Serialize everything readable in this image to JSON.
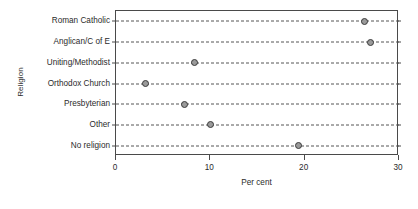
{
  "chart_data": {
    "type": "scatter",
    "title": "",
    "xlabel": "Per cent",
    "ylabel": "Religion",
    "categories": [
      "Roman Catholic",
      "Anglican/C of E",
      "Uniting/Methodist",
      "Orthodox Church",
      "Presbyterian",
      "Other",
      "No religion"
    ],
    "values": [
      26.3,
      27.0,
      8.3,
      3.1,
      7.3,
      10.0,
      19.3
    ],
    "xlim": [
      0,
      30
    ],
    "xticks": [
      0,
      10,
      20,
      30
    ],
    "xtick_labels": [
      "0",
      "10",
      "20",
      "30"
    ],
    "grid": "dashed-horizontal",
    "legend": "none",
    "orientation": "horizontal",
    "marker": {
      "shape": "circle",
      "fill_color": "#9a9a9a",
      "edge_color": "#3a3a3a"
    },
    "colors": {
      "axis": "#4a4a4a",
      "gridline": "#555555",
      "text": "#2b2b2b",
      "background": "#ffffff"
    }
  }
}
